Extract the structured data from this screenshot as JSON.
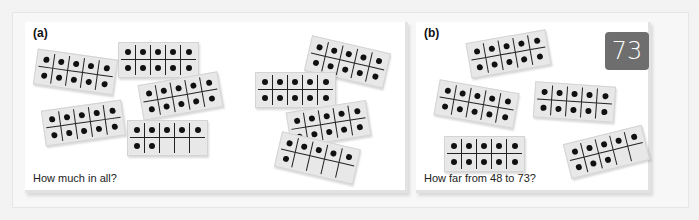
{
  "panels": {
    "a": {
      "label": "(a)",
      "caption": "How much in all?",
      "frames": [
        {
          "dots": 10,
          "x": 10,
          "y": 32,
          "rot": 8
        },
        {
          "dots": 10,
          "x": 93,
          "y": 20,
          "rot": 0
        },
        {
          "dots": 10,
          "x": 115,
          "y": 56,
          "rot": -10
        },
        {
          "dots": 10,
          "x": 18,
          "y": 83,
          "rot": -8
        },
        {
          "dots": 7,
          "x": 102,
          "y": 98,
          "rot": 0
        },
        {
          "dots": 10,
          "x": 282,
          "y": 22,
          "rot": 13
        },
        {
          "dots": 10,
          "x": 230,
          "y": 50,
          "rot": 0
        },
        {
          "dots": 10,
          "x": 263,
          "y": 84,
          "rot": -9
        },
        {
          "dots": 6,
          "x": 252,
          "y": 118,
          "rot": 13
        }
      ]
    },
    "b": {
      "label": "(b)",
      "caption": "How far from 48 to 73?",
      "number_card": "73",
      "frames": [
        {
          "dots": 10,
          "x": 52,
          "y": 14,
          "rot": -10
        },
        {
          "dots": 10,
          "x": 20,
          "y": 64,
          "rot": 10
        },
        {
          "dots": 10,
          "x": 118,
          "y": 62,
          "rot": 4
        },
        {
          "dots": 10,
          "x": 28,
          "y": 114,
          "rot": 0
        },
        {
          "dots": 8,
          "x": 150,
          "y": 112,
          "rot": -14
        }
      ]
    }
  },
  "colors": {
    "frame_bg": "#e8e8e8",
    "dot": "#111111",
    "card_bg": "#6e6e6e"
  }
}
